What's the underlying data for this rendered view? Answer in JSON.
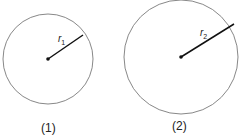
{
  "figures": [
    {
      "id": "1",
      "caption": "(1)",
      "radius_label": "r",
      "radius_sub": "1",
      "center": [
        48,
        59
      ],
      "radius": 45
    },
    {
      "id": "2",
      "caption": "(2)",
      "radius_label": "r",
      "radius_sub": "2",
      "center": [
        181,
        57
      ],
      "radius": 57
    }
  ],
  "colors": {
    "circle": "#888888",
    "radius": "#111111"
  }
}
